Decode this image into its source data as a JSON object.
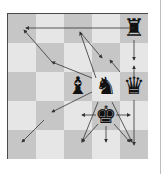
{
  "diagram": {
    "type": "chess-movement-diagram",
    "board": {
      "cols": 5,
      "rows": 5,
      "top_left": "dark",
      "colors": {
        "dark": "#c6c6c6",
        "light": "#e6e6e6",
        "border": "#4a4a4a",
        "arrow": "#333333"
      }
    },
    "pieces": [
      {
        "name": "rook",
        "glyph": "♜",
        "col": 4,
        "row": 0
      },
      {
        "name": "bishop",
        "glyph": "♝",
        "col": 2,
        "row": 2
      },
      {
        "name": "knight",
        "glyph": "♞",
        "col": 3,
        "row": 2
      },
      {
        "name": "queen",
        "glyph": "♛",
        "col": 4,
        "row": 2
      },
      {
        "name": "king",
        "glyph": "♚",
        "col": 3,
        "row": 3
      }
    ],
    "arrows": [
      {
        "from": [
          134,
          28
        ],
        "to": [
          26,
          28
        ],
        "label": "rook-left"
      },
      {
        "from": [
          134,
          40
        ],
        "to": [
          134,
          60
        ],
        "label": "rook-down"
      },
      {
        "from": [
          134,
          80
        ],
        "to": [
          134,
          66
        ],
        "label": "queen-up"
      },
      {
        "from": [
          134,
          100
        ],
        "to": [
          134,
          145
        ],
        "label": "queen-down"
      },
      {
        "from": [
          96,
          78
        ],
        "to": [
          80,
          32
        ],
        "label": "knight-up-left"
      },
      {
        "from": [
          80,
          32
        ],
        "to": [
          102,
          58
        ],
        "label": "diag-a"
      },
      {
        "from": [
          120,
          72
        ],
        "to": [
          110,
          60
        ],
        "label": "diag-b"
      },
      {
        "from": [
          92,
          78
        ],
        "to": [
          52,
          62
        ],
        "label": "knight-to-b3"
      },
      {
        "from": [
          52,
          62
        ],
        "to": [
          24,
          30
        ],
        "label": "bishop-diag-up-left"
      },
      {
        "from": [
          92,
          92
        ],
        "to": [
          52,
          112
        ],
        "label": "knight-to-b2"
      },
      {
        "from": [
          44,
          120
        ],
        "to": [
          22,
          142
        ],
        "label": "bishop-diag-down-left"
      },
      {
        "from": [
          98,
          102
        ],
        "to": [
          82,
          142
        ],
        "label": "knight-down-left"
      },
      {
        "from": [
          112,
          102
        ],
        "to": [
          132,
          142
        ],
        "label": "knight-down-right"
      },
      {
        "from": [
          96,
          115
        ],
        "to": [
          82,
          115
        ],
        "label": "king-left"
      },
      {
        "from": [
          116,
          115
        ],
        "to": [
          130,
          115
        ],
        "label": "king-right"
      },
      {
        "from": [
          106,
          126
        ],
        "to": [
          106,
          142
        ],
        "label": "king-down"
      },
      {
        "from": [
          98,
          124
        ],
        "to": [
          82,
          142
        ],
        "label": "king-down-left"
      },
      {
        "from": [
          114,
          124
        ],
        "to": [
          130,
          142
        ],
        "label": "king-down-right"
      }
    ]
  }
}
